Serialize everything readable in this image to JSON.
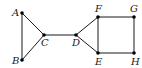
{
  "diagram": {
    "type": "graph",
    "colors": {
      "edge": "#1a1a1a",
      "node": "#000000",
      "background": "#ffffff"
    },
    "nodes": [
      {
        "id": "A",
        "label": "A",
        "x": 22,
        "y": 13,
        "lx": 12,
        "ly": 16
      },
      {
        "id": "B",
        "label": "B",
        "x": 22,
        "y": 60,
        "lx": 12,
        "ly": 64
      },
      {
        "id": "C",
        "label": "C",
        "x": 44,
        "y": 35,
        "lx": 41,
        "ly": 46
      },
      {
        "id": "D",
        "label": "D",
        "x": 76,
        "y": 35,
        "lx": 72,
        "ly": 46
      },
      {
        "id": "F",
        "label": "F",
        "x": 98,
        "y": 17,
        "lx": 95,
        "ly": 12
      },
      {
        "id": "G",
        "label": "G",
        "x": 134,
        "y": 17,
        "lx": 130,
        "ly": 12
      },
      {
        "id": "E",
        "label": "E",
        "x": 98,
        "y": 53,
        "lx": 95,
        "ly": 65
      },
      {
        "id": "H",
        "label": "H",
        "x": 134,
        "y": 53,
        "lx": 131,
        "ly": 65
      }
    ],
    "edges": [
      [
        "A",
        "B"
      ],
      [
        "A",
        "C"
      ],
      [
        "B",
        "C"
      ],
      [
        "C",
        "D"
      ],
      [
        "D",
        "F"
      ],
      [
        "D",
        "E"
      ],
      [
        "F",
        "G"
      ],
      [
        "F",
        "E"
      ],
      [
        "G",
        "H"
      ],
      [
        "E",
        "H"
      ]
    ]
  }
}
